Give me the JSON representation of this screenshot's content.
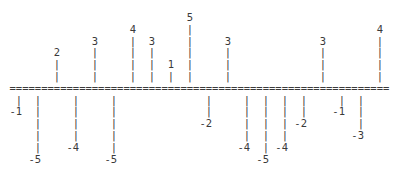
{
  "chart_data": {
    "type": "bar",
    "style": "ascii-art",
    "title": "",
    "xlabel": "",
    "ylabel": "",
    "baseline_char": "=",
    "bar_char": "|",
    "categories": [
      1,
      2,
      3,
      4,
      5,
      6,
      7,
      8,
      9,
      10,
      11,
      12,
      13,
      14,
      15,
      16,
      17,
      18,
      19,
      20
    ],
    "values": [
      -1,
      -5,
      2,
      -4,
      3,
      -5,
      4,
      3,
      1,
      5,
      -2,
      3,
      -4,
      -5,
      -4,
      -2,
      3,
      -1,
      -3,
      4
    ],
    "ylim": [
      -5,
      5
    ],
    "grid": false,
    "legend": null,
    "color": "#3a3a3a"
  }
}
